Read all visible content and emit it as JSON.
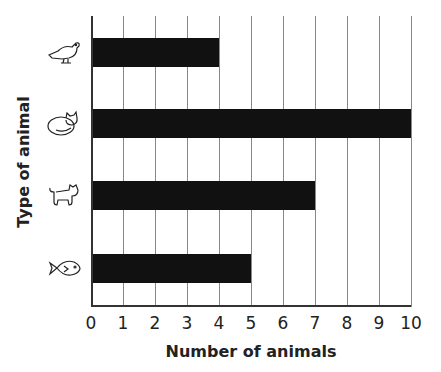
{
  "chart_data": {
    "type": "bar",
    "orientation": "horizontal",
    "title": "",
    "categories": [
      "bird",
      "cat",
      "dog",
      "fish"
    ],
    "values": [
      4,
      10,
      7,
      5
    ],
    "xlabel": "Number of animals",
    "ylabel": "Type of animal",
    "xlim": [
      0,
      10
    ],
    "xticks": [
      "0",
      "1",
      "2",
      "3",
      "4",
      "5",
      "6",
      "7",
      "8",
      "9",
      "10"
    ],
    "grid": "vertical",
    "bar_color": "#111111",
    "category_icons": [
      "bird-icon",
      "cat-icon",
      "dog-icon",
      "fish-icon"
    ]
  }
}
